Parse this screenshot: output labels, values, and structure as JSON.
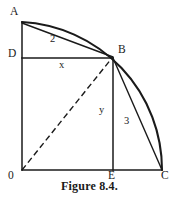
{
  "figure": {
    "caption": "Figure 8.4.",
    "type": "geometry-diagram",
    "points": [
      {
        "id": "A",
        "label": "A",
        "x": 22,
        "y": 22,
        "label_x": 10,
        "label_y": 6
      },
      {
        "id": "B",
        "label": "B",
        "x": 113,
        "y": 58,
        "label_x": 118,
        "label_y": 44
      },
      {
        "id": "C",
        "label": "C",
        "x": 162,
        "y": 170,
        "label_x": 161,
        "label_y": 171
      },
      {
        "id": "D",
        "label": "D",
        "x": 22,
        "y": 58,
        "label_x": 8,
        "label_y": 48
      },
      {
        "id": "E",
        "label": "E",
        "x": 113,
        "y": 170,
        "label_x": 108,
        "label_y": 171
      },
      {
        "id": "O",
        "label": "0",
        "x": 22,
        "y": 170,
        "label_x": 8,
        "label_y": 171
      }
    ],
    "segment_labels": [
      {
        "id": "chord-ab-length",
        "text": "2",
        "x": 50,
        "y": 34
      },
      {
        "id": "segment-db-length",
        "text": "x",
        "x": 59,
        "y": 60
      },
      {
        "id": "segment-be-length",
        "text": "y",
        "x": 99,
        "y": 105
      },
      {
        "id": "chord-bc-length",
        "text": "3",
        "x": 124,
        "y": 116
      }
    ],
    "colors": {
      "stroke": "#1a1a1a",
      "background": "#ffffff",
      "text": "#1a1a1a"
    }
  }
}
